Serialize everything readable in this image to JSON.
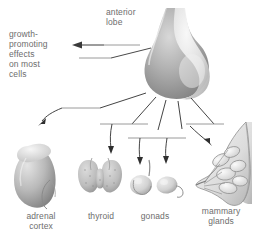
{
  "figure": {
    "background_color": "#ffffff",
    "text_color": "#6d6d6d"
  },
  "labels": {
    "growth_effects": "growth-\npromoting\neffects\non most\ncells",
    "anterior_lobe": "anterior\nlobe",
    "adrenal_cortex": "adrenal\ncortex",
    "thyroid": "thyroid",
    "gonads": "gonads",
    "mammary_glands": "mammary\nglands"
  },
  "structures": {
    "pituitary": "pituitary-gland",
    "adrenal": "adrenal-gland",
    "thyroid": "thyroid-gland",
    "gonad_testis": "testis",
    "gonad_ovary": "ovary",
    "breast": "mammary-gland"
  },
  "connectors": {
    "growth_arrow": "arrow-left",
    "adrenal_arrow": "arrow-down-left",
    "thyroid_arrow": "arrow-down",
    "testis_arrow": "arrow-down",
    "ovary_arrow": "arrow-down",
    "breast_arrow": "arrow-down-right"
  }
}
